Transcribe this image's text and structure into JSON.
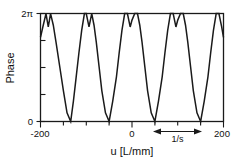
{
  "chart_data": {
    "type": "line",
    "title": "",
    "xlabel": "u [L/mm]",
    "ylabel": "Phase",
    "xlim": [
      -200,
      200
    ],
    "ylim": [
      0,
      6.283185307
    ],
    "grid": false,
    "legend": null,
    "x_ticks": [
      -200,
      0,
      200
    ],
    "x_tick_labels": [
      "-200",
      "0",
      "200"
    ],
    "x_minor_ticks": [
      -150,
      -100,
      -50,
      50,
      100,
      150
    ],
    "y_ticks": [
      0,
      6.283185307
    ],
    "y_tick_labels": [
      "0",
      "2π"
    ],
    "y_minor_ticks": [
      1.5707963,
      3.1415927,
      4.712389
    ],
    "series": [
      {
        "name": "phase",
        "comment": "Periodic sawtooth-like phase ramp, period 100 L/mm, wrapped to [0,2pi], with a notch dip at each 2pi crest producing a double-peak (M) shape.",
        "x": [
          -200,
          -194,
          -188,
          -183,
          -178,
          -172,
          -166,
          -158,
          -150,
          -142,
          -134,
          -128,
          -122,
          -116,
          -110,
          -104,
          -100,
          -94,
          -88,
          -83,
          -78,
          -72,
          -66,
          -58,
          -50,
          -42,
          -34,
          -28,
          -22,
          -16,
          -10,
          -4,
          0,
          6,
          12,
          17,
          22,
          28,
          34,
          42,
          50,
          58,
          66,
          72,
          78,
          84,
          90,
          96,
          100,
          106,
          112,
          117,
          122,
          128,
          134,
          142,
          150,
          158,
          166,
          172,
          178,
          184,
          190,
          196,
          200
        ],
        "y": [
          4.9,
          5.6,
          6.28,
          5.5,
          6.28,
          5.6,
          4.6,
          3.2,
          1.8,
          0.5,
          0.0,
          1.2,
          2.6,
          4.0,
          5.3,
          6.28,
          6.28,
          5.5,
          6.28,
          5.6,
          4.6,
          3.2,
          1.8,
          0.5,
          0.0,
          1.2,
          2.6,
          4.0,
          5.3,
          6.28,
          6.28,
          5.5,
          5.9,
          6.28,
          6.28,
          5.6,
          4.6,
          3.2,
          1.8,
          0.5,
          0.0,
          1.2,
          2.6,
          4.0,
          5.3,
          6.28,
          6.28,
          5.5,
          5.9,
          6.28,
          6.28,
          5.6,
          4.6,
          3.2,
          1.8,
          0.5,
          0.0,
          1.2,
          2.6,
          4.0,
          5.3,
          6.28,
          6.28,
          5.5,
          4.9
        ]
      }
    ],
    "annotations": [
      {
        "name": "period-span",
        "label": "1/s",
        "type": "double-arrow",
        "x_start": 50,
        "x_end": 150,
        "value": 100
      }
    ]
  },
  "axes": {
    "y_label": "Phase",
    "y_tick_top": "2π",
    "y_tick_bottom": "0",
    "x_tick_left": "-200",
    "x_tick_mid": "0",
    "x_tick_right": "200",
    "x_label": "u [L/mm]"
  },
  "annotation": {
    "period_label": "1/s"
  },
  "colors": {
    "curve": "#1a1a1a",
    "axis": "#1a1a1a",
    "text": "#111111",
    "background": "#ffffff"
  }
}
